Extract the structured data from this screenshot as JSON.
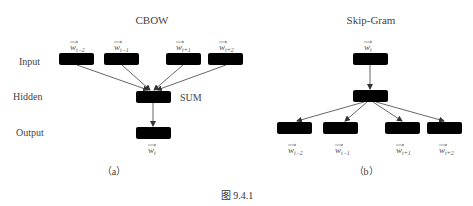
{
  "figure": {
    "caption": "图 9.4.1"
  },
  "row_labels": {
    "input": "Input",
    "hidden": "Hidden",
    "output": "Output"
  },
  "cbow": {
    "title": "CBOW",
    "panel_label": "（a）",
    "hidden_op": "SUM",
    "inputs": [
      {
        "word": "w",
        "sub": "t−2"
      },
      {
        "word": "w",
        "sub": "t−1"
      },
      {
        "word": "w",
        "sub": "t+1"
      },
      {
        "word": "w",
        "sub": "t+2"
      }
    ],
    "output": {
      "word": "w",
      "sub": "t"
    }
  },
  "skipgram": {
    "title": "Skip-Gram",
    "panel_label": "（b）",
    "input": {
      "word": "w",
      "sub": "t"
    },
    "outputs": [
      {
        "word": "w",
        "sub": "t−2"
      },
      {
        "word": "w",
        "sub": "t−1"
      },
      {
        "word": "w",
        "sub": "t+1"
      },
      {
        "word": "w",
        "sub": "t+2"
      }
    ]
  },
  "colors": {
    "box_fill": "#a9a9a9",
    "box_stroke": "#555555",
    "neuron_fill": "#c9c9c9",
    "edge": "#555555"
  }
}
